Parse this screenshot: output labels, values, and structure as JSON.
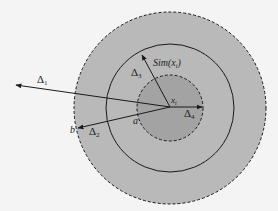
{
  "diagram": {
    "title": "",
    "labels": {
      "delta1": "Δ",
      "delta1_sub": "1",
      "delta2": "Δ",
      "delta2_sub": "2",
      "delta3": "Δ",
      "delta3_sub": "3",
      "delta4": "Δ",
      "delta4_sub": "4",
      "sim": "Sim(x",
      "sim_sub": "i",
      "sim_close": ")",
      "center": "x",
      "center_sub": "i",
      "point_a": "a",
      "point_b": "b"
    },
    "colors": {
      "background": "#f4f4f4",
      "outer_fill": "#b9b9b9",
      "inner_fill": "#a3a3a3",
      "stroke": "#1a1a1a"
    },
    "circles": [
      {
        "name": "outer",
        "style": "dashed",
        "radius": 96
      },
      {
        "name": "middle",
        "style": "solid",
        "radius": 64
      },
      {
        "name": "inner",
        "style": "dashed",
        "radius": 33
      }
    ]
  }
}
